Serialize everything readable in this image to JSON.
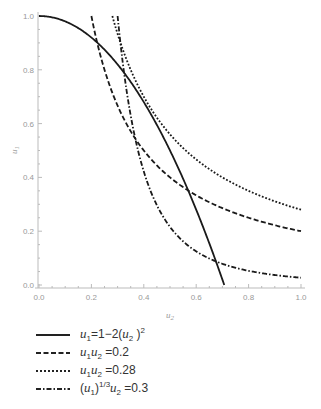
{
  "chart_data": {
    "type": "line",
    "title": "",
    "xlabel": "u2",
    "ylabel": "u1",
    "xlim": [
      0,
      1.0
    ],
    "ylim": [
      0,
      1.0
    ],
    "xticks": [
      "0.0",
      "0.2",
      "0.4",
      "0.6",
      "0.8",
      "1.0"
    ],
    "yticks": [
      "0.0",
      "0.2",
      "0.4",
      "0.6",
      "0.8",
      "1.0"
    ],
    "grid": false,
    "legend_position": "below",
    "series": [
      {
        "name": "u1=1-2(u2)^2",
        "style": "solid",
        "formula": "u1 = 1 - 2*u2^2",
        "x_range": [
          0,
          0.7071
        ],
        "points": [
          [
            0,
            1.0
          ],
          [
            0.1,
            0.98
          ],
          [
            0.2,
            0.92
          ],
          [
            0.3,
            0.82
          ],
          [
            0.4,
            0.68
          ],
          [
            0.5,
            0.5
          ],
          [
            0.6,
            0.28
          ],
          [
            0.7071,
            0.0
          ]
        ]
      },
      {
        "name": "u1u2=0.2",
        "style": "dashed",
        "formula": "u1 = 0.2/u2",
        "x_range": [
          0.2,
          1.0
        ],
        "points": [
          [
            0.2,
            1.0
          ],
          [
            0.25,
            0.8
          ],
          [
            0.3,
            0.667
          ],
          [
            0.4,
            0.5
          ],
          [
            0.5,
            0.4
          ],
          [
            0.6,
            0.333
          ],
          [
            0.8,
            0.25
          ],
          [
            1.0,
            0.2
          ]
        ]
      },
      {
        "name": "u1u2=0.28",
        "style": "dotted",
        "formula": "u1 = 0.28/u2",
        "x_range": [
          0.28,
          1.0
        ],
        "points": [
          [
            0.28,
            1.0
          ],
          [
            0.3,
            0.933
          ],
          [
            0.4,
            0.7
          ],
          [
            0.5,
            0.56
          ],
          [
            0.6,
            0.467
          ],
          [
            0.8,
            0.35
          ],
          [
            1.0,
            0.28
          ]
        ]
      },
      {
        "name": "(u1)^(1/3)u2=0.3",
        "style": "dashdot",
        "formula": "u1 = (0.3/u2)^3",
        "x_range": [
          0.3,
          1.0
        ],
        "points": [
          [
            0.3,
            1.0
          ],
          [
            0.35,
            0.63
          ],
          [
            0.4,
            0.422
          ],
          [
            0.5,
            0.216
          ],
          [
            0.6,
            0.125
          ],
          [
            0.7,
            0.079
          ],
          [
            0.8,
            0.053
          ],
          [
            1.0,
            0.027
          ]
        ]
      }
    ]
  },
  "axes": {
    "x_label": "u",
    "x_label_sub": "2",
    "y_label": "u",
    "y_label_sub": "1"
  },
  "legend": {
    "items": [
      {
        "style": "solid"
      },
      {
        "style": "dashed"
      },
      {
        "style": "dotted"
      },
      {
        "style": "dashdot"
      }
    ],
    "l0": {
      "a": "u",
      "a_sub": "1",
      "b": "=1−2(",
      "c": "u",
      "c_sub": "2",
      "d": " )",
      "d_sup": "2"
    },
    "l1": {
      "a": "u",
      "a_sub": "1",
      "c": "u",
      "c_sub": "2",
      "d": " =0.2"
    },
    "l2": {
      "a": "u",
      "a_sub": "1",
      "c": "u",
      "c_sub": "2",
      "d": " =0.28"
    },
    "l3": {
      "p": "(",
      "a": "u",
      "a_sub": "1",
      "q": ")",
      "q_sup": "1/3",
      "c": "u",
      "c_sub": "2",
      "d": " =0.3"
    }
  }
}
